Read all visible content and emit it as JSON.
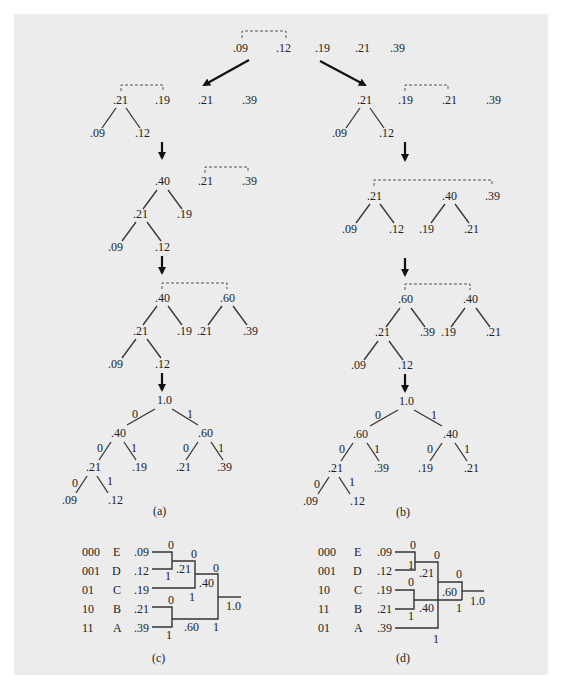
{
  "figure": {
    "background": "#ececec",
    "top_row": [
      ".09",
      ".12",
      ".19",
      ".21",
      ".39"
    ],
    "captions": {
      "a": "(a)",
      "b": "(b)",
      "c": "(c)",
      "d": "(d)"
    },
    "branch_labels": {
      "zero": "0",
      "one": "1"
    }
  },
  "panel_a": {
    "step1": {
      "root": ".21",
      "leaves": [
        ".09",
        ".12"
      ],
      "others": [
        ".19",
        ".21",
        ".39"
      ]
    },
    "step2": {
      "root": ".40",
      "mid": ".21",
      "right": ".19",
      "leaves": [
        ".09",
        ".12"
      ],
      "others": [
        ".21",
        ".39"
      ]
    },
    "step3": {
      "left_root": ".40",
      "right_root": ".60",
      "mid": ".21",
      "n19": ".19",
      "n21": ".21",
      "n39": ".39",
      "leaves": [
        ".09",
        ".12"
      ]
    },
    "final": {
      "root": "1.0",
      "n40": ".40",
      "n60": ".60",
      "n21a": ".21",
      "n19": ".19",
      "n21b": ".21",
      "n39": ".39",
      "n09": ".09",
      "n12": ".12"
    }
  },
  "panel_b": {
    "step1": {
      "root": ".21",
      "leaves": [
        ".09",
        ".12"
      ],
      "others": [
        ".19",
        ".21",
        ".39"
      ]
    },
    "step2": {
      "left_root": ".21",
      "right_root": ".40",
      "n39": ".39",
      "leaves": [
        ".09",
        ".12",
        ".19",
        ".21"
      ]
    },
    "step3": {
      "left_root": ".60",
      "right_root": ".40",
      "mid": ".21",
      "n39": ".39",
      "n19": ".19",
      "n21": ".21",
      "leaves": [
        ".09",
        ".12"
      ]
    },
    "final": {
      "root": "1.0",
      "n60": ".60",
      "n40": ".40",
      "n21a": ".21",
      "n39": ".39",
      "n19": ".19",
      "n21b": ".21",
      "n09": ".09",
      "n12": ".12"
    }
  },
  "panel_c": {
    "rows": [
      {
        "code": "000",
        "symbol": "E",
        "prob": ".09"
      },
      {
        "code": "001",
        "symbol": "D",
        "prob": ".12"
      },
      {
        "code": "01",
        "symbol": "C",
        "prob": ".19"
      },
      {
        "code": "10",
        "symbol": "B",
        "prob": ".21"
      },
      {
        "code": "11",
        "symbol": "A",
        "prob": ".39"
      }
    ],
    "internal": {
      "n21": ".21",
      "n40": ".40",
      "n60": ".60",
      "root": "1.0"
    }
  },
  "panel_d": {
    "rows": [
      {
        "code": "000",
        "symbol": "E",
        "prob": ".09"
      },
      {
        "code": "001",
        "symbol": "D",
        "prob": ".12"
      },
      {
        "code": "10",
        "symbol": "C",
        "prob": ".19"
      },
      {
        "code": "11",
        "symbol": "B",
        "prob": ".21"
      },
      {
        "code": "01",
        "symbol": "A",
        "prob": ".39"
      }
    ],
    "internal": {
      "n21": ".21",
      "n40": ".40",
      "n60": ".60",
      "root": "1.0"
    }
  }
}
